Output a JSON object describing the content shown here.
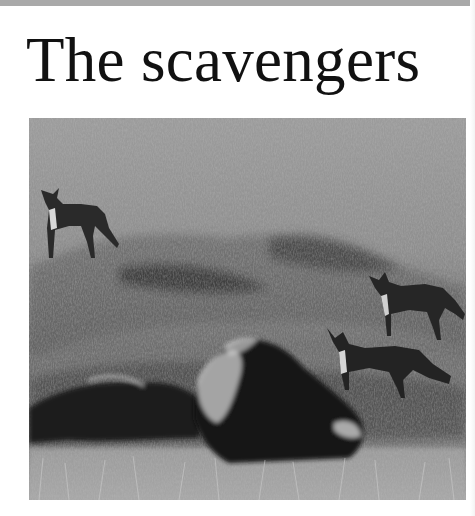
{
  "page": {
    "title": "The scavengers",
    "strip_color": "#a9a9a9"
  },
  "photo": {
    "description": "Black-and-white photograph of three jackals on a grassy slope with a lion lying in the foreground",
    "subjects": [
      {
        "name": "jackal",
        "position": "upper-left"
      },
      {
        "name": "jackal",
        "position": "right"
      },
      {
        "name": "jackal",
        "position": "right-lower"
      },
      {
        "name": "lion",
        "position": "bottom-center"
      },
      {
        "name": "carcass",
        "position": "bottom-left"
      }
    ],
    "tone": "grayscale"
  }
}
